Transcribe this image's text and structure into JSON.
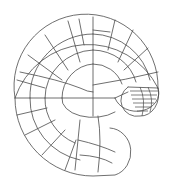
{
  "diagram": {
    "title": "",
    "type": "spiral segmented line drawing",
    "stroke_color": "#4a4a4a",
    "background_color": "#ffffff",
    "center": [
      93,
      98
    ],
    "outer_radius": 78,
    "regions": [
      {
        "name": "outer-spiral-band",
        "description": "Outer ring segmented into cells"
      },
      {
        "name": "middle-spiral-band",
        "description": "Middle ring segmented into cells"
      },
      {
        "name": "inner-core-circle",
        "description": "Central circle divided by cross lines"
      },
      {
        "name": "lower-lobe",
        "description": "Small lobe below center"
      },
      {
        "name": "right-lobe",
        "description": "Small lobe to the right of center"
      },
      {
        "name": "hatched-chamber",
        "description": "Hatched semicircular chamber at right"
      }
    ]
  }
}
